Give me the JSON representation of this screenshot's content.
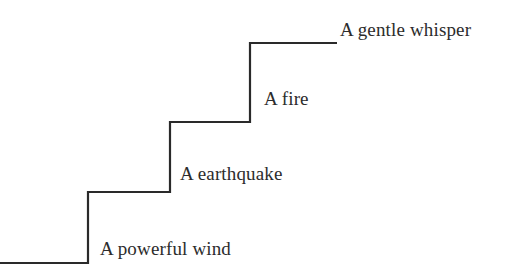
{
  "figure": {
    "name": "ascending-staircase-diagram",
    "background_color": "#ffffff",
    "stroke_color": "#2a2a2a",
    "text_color": "#2c2c2c",
    "width": 508,
    "height": 267
  },
  "chart_data": {
    "type": "line",
    "title": "",
    "xlabel": "",
    "ylabel": "",
    "grid": false,
    "legend": "none",
    "xlim": [
      0,
      508
    ],
    "ylim": [
      0,
      267
    ],
    "categories": [
      "A powerful wind",
      "A earthquake",
      "A fire",
      "A gentle whisper"
    ],
    "values": [
      1,
      2,
      3,
      4
    ],
    "step_levels_y": [
      263,
      192,
      122,
      43
    ],
    "riser_x": [
      88,
      170,
      250
    ],
    "polyline_points": "0,263 88,263 88,192 170,192 170,122 250,122 250,43 337,43",
    "stroke_width": 2.2
  },
  "labels": [
    {
      "id": "powerful-wind",
      "text": "A powerful wind",
      "x": 100,
      "baseline_y": 255,
      "step": 1
    },
    {
      "id": "earthquake",
      "text": "A earthquake",
      "x": 180,
      "baseline_y": 180,
      "step": 2
    },
    {
      "id": "fire",
      "text": "A fire",
      "x": 264,
      "baseline_y": 105,
      "step": 3
    },
    {
      "id": "gentle-whisper",
      "text": "A gentle whisper",
      "x": 340,
      "baseline_y": 36,
      "step": 4
    }
  ]
}
